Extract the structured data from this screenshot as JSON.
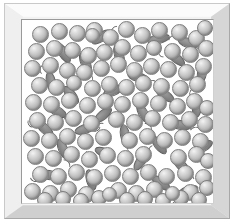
{
  "figure": {
    "frame": {
      "style": "beveled-3d-picture-frame",
      "outer_color": "#f2f2f2",
      "bevel_top_color": "#fbfbfb",
      "bevel_left_color": "#efefef",
      "bevel_right_color": "#d6d6d6",
      "bevel_bottom_color": "#cfcfcf",
      "inner_border_color": "#9a9a9a",
      "interior_background": "#ffffff"
    },
    "legend": {
      "sphere_label": "sphere particle",
      "worm_label": "rod particle with tail"
    }
  },
  "chart_data": {
    "type": "scatter",
    "xlabel": "",
    "ylabel": "",
    "xlim": [
      0,
      193
    ],
    "ylim": [
      0,
      185
    ],
    "grid": false,
    "legend_position": "none",
    "counts": {
      "spheres": 113,
      "worms": 31
    },
    "sphere_style": {
      "diameter_px": 17,
      "fill_highlight": "#f4f4f4",
      "fill_mid": "#c0c0c0",
      "fill_shadow": "#8e8e8e",
      "outline": "#7d7d7d"
    },
    "worm_style": {
      "length_px": 22,
      "width_px": 10,
      "fill_highlight": "#9e9e9e",
      "fill_shadow": "#6e6e6e",
      "outline": "#5f5f5f",
      "tail": "thin-curved-whisker"
    },
    "series": [
      {
        "name": "spheres",
        "marker": "circle",
        "points": [
          {
            "x": 10,
            "y": 6,
            "d": 17
          },
          {
            "x": 29,
            "y": 3,
            "d": 17
          },
          {
            "x": 47,
            "y": 5,
            "d": 17
          },
          {
            "x": 64,
            "y": 2,
            "d": 17
          },
          {
            "x": 80,
            "y": 9,
            "d": 17
          },
          {
            "x": 96,
            "y": 1,
            "d": 17
          },
          {
            "x": 112,
            "y": 7,
            "d": 17
          },
          {
            "x": 129,
            "y": 2,
            "d": 17
          },
          {
            "x": 149,
            "y": 4,
            "d": 17
          },
          {
            "x": 166,
            "y": 10,
            "d": 17
          },
          {
            "x": 175,
            "y": 0,
            "d": 16
          },
          {
            "x": 6,
            "y": 23,
            "d": 17
          },
          {
            "x": 24,
            "y": 20,
            "d": 17
          },
          {
            "x": 42,
            "y": 22,
            "d": 17
          },
          {
            "x": 58,
            "y": 27,
            "d": 17
          },
          {
            "x": 74,
            "y": 24,
            "d": 17
          },
          {
            "x": 92,
            "y": 19,
            "d": 17
          },
          {
            "x": 108,
            "y": 25,
            "d": 17
          },
          {
            "x": 124,
            "y": 20,
            "d": 16
          },
          {
            "x": 142,
            "y": 23,
            "d": 17
          },
          {
            "x": 160,
            "y": 26,
            "d": 17
          },
          {
            "x": 176,
            "y": 20,
            "d": 17
          },
          {
            "x": 2,
            "y": 40,
            "d": 17
          },
          {
            "x": 20,
            "y": 37,
            "d": 17
          },
          {
            "x": 37,
            "y": 42,
            "d": 17
          },
          {
            "x": 54,
            "y": 44,
            "d": 17
          },
          {
            "x": 71,
            "y": 40,
            "d": 17
          },
          {
            "x": 88,
            "y": 36,
            "d": 17
          },
          {
            "x": 104,
            "y": 42,
            "d": 17
          },
          {
            "x": 121,
            "y": 38,
            "d": 17
          },
          {
            "x": 138,
            "y": 41,
            "d": 17
          },
          {
            "x": 156,
            "y": 44,
            "d": 17
          },
          {
            "x": 173,
            "y": 38,
            "d": 17
          },
          {
            "x": 9,
            "y": 57,
            "d": 17
          },
          {
            "x": 26,
            "y": 59,
            "d": 17
          },
          {
            "x": 44,
            "y": 55,
            "d": 16
          },
          {
            "x": 62,
            "y": 60,
            "d": 17
          },
          {
            "x": 79,
            "y": 56,
            "d": 17
          },
          {
            "x": 96,
            "y": 59,
            "d": 17
          },
          {
            "x": 113,
            "y": 55,
            "d": 17
          },
          {
            "x": 131,
            "y": 58,
            "d": 17
          },
          {
            "x": 150,
            "y": 60,
            "d": 17
          },
          {
            "x": 167,
            "y": 56,
            "d": 17
          },
          {
            "x": 3,
            "y": 74,
            "d": 17
          },
          {
            "x": 21,
            "y": 76,
            "d": 17
          },
          {
            "x": 39,
            "y": 72,
            "d": 17
          },
          {
            "x": 57,
            "y": 77,
            "d": 17
          },
          {
            "x": 75,
            "y": 73,
            "d": 17
          },
          {
            "x": 92,
            "y": 76,
            "d": 17
          },
          {
            "x": 110,
            "y": 72,
            "d": 17
          },
          {
            "x": 128,
            "y": 75,
            "d": 17
          },
          {
            "x": 147,
            "y": 78,
            "d": 17
          },
          {
            "x": 164,
            "y": 73,
            "d": 17
          },
          {
            "x": 177,
            "y": 80,
            "d": 16
          },
          {
            "x": 7,
            "y": 92,
            "d": 17
          },
          {
            "x": 25,
            "y": 94,
            "d": 17
          },
          {
            "x": 43,
            "y": 90,
            "d": 17
          },
          {
            "x": 61,
            "y": 95,
            "d": 17
          },
          {
            "x": 86,
            "y": 91,
            "d": 17
          },
          {
            "x": 104,
            "y": 94,
            "d": 17
          },
          {
            "x": 122,
            "y": 90,
            "d": 17
          },
          {
            "x": 140,
            "y": 94,
            "d": 17
          },
          {
            "x": 159,
            "y": 91,
            "d": 17
          },
          {
            "x": 175,
            "y": 96,
            "d": 17
          },
          {
            "x": 1,
            "y": 110,
            "d": 17
          },
          {
            "x": 19,
            "y": 112,
            "d": 17
          },
          {
            "x": 37,
            "y": 108,
            "d": 17
          },
          {
            "x": 55,
            "y": 113,
            "d": 17
          },
          {
            "x": 73,
            "y": 109,
            "d": 17
          },
          {
            "x": 99,
            "y": 112,
            "d": 17
          },
          {
            "x": 117,
            "y": 108,
            "d": 17
          },
          {
            "x": 134,
            "y": 112,
            "d": 17
          },
          {
            "x": 152,
            "y": 109,
            "d": 17
          },
          {
            "x": 170,
            "y": 113,
            "d": 17
          },
          {
            "x": 5,
            "y": 128,
            "d": 17
          },
          {
            "x": 23,
            "y": 130,
            "d": 17
          },
          {
            "x": 41,
            "y": 126,
            "d": 17
          },
          {
            "x": 59,
            "y": 131,
            "d": 17
          },
          {
            "x": 77,
            "y": 127,
            "d": 17
          },
          {
            "x": 95,
            "y": 130,
            "d": 17
          },
          {
            "x": 113,
            "y": 126,
            "d": 17
          },
          {
            "x": 148,
            "y": 129,
            "d": 17
          },
          {
            "x": 166,
            "y": 126,
            "d": 17
          },
          {
            "x": 178,
            "y": 133,
            "d": 16
          },
          {
            "x": 10,
            "y": 146,
            "d": 17
          },
          {
            "x": 28,
            "y": 148,
            "d": 17
          },
          {
            "x": 46,
            "y": 144,
            "d": 17
          },
          {
            "x": 64,
            "y": 149,
            "d": 17
          },
          {
            "x": 82,
            "y": 145,
            "d": 17
          },
          {
            "x": 100,
            "y": 148,
            "d": 17
          },
          {
            "x": 118,
            "y": 144,
            "d": 17
          },
          {
            "x": 136,
            "y": 148,
            "d": 17
          },
          {
            "x": 155,
            "y": 145,
            "d": 17
          },
          {
            "x": 173,
            "y": 149,
            "d": 17
          },
          {
            "x": 2,
            "y": 163,
            "d": 17
          },
          {
            "x": 20,
            "y": 165,
            "d": 17
          },
          {
            "x": 38,
            "y": 161,
            "d": 17
          },
          {
            "x": 56,
            "y": 166,
            "d": 17
          },
          {
            "x": 88,
            "y": 162,
            "d": 17
          },
          {
            "x": 106,
            "y": 165,
            "d": 17
          },
          {
            "x": 124,
            "y": 161,
            "d": 17
          },
          {
            "x": 160,
            "y": 164,
            "d": 17
          },
          {
            "x": 177,
            "y": 160,
            "d": 16
          },
          {
            "x": 15,
            "y": 172,
            "d": 16
          },
          {
            "x": 33,
            "y": 171,
            "d": 16
          },
          {
            "x": 51,
            "y": 173,
            "d": 16
          },
          {
            "x": 69,
            "y": 170,
            "d": 16
          },
          {
            "x": 97,
            "y": 172,
            "d": 16
          },
          {
            "x": 115,
            "y": 171,
            "d": 16
          },
          {
            "x": 133,
            "y": 173,
            "d": 16
          },
          {
            "x": 151,
            "y": 170,
            "d": 16
          },
          {
            "x": 169,
            "y": 172,
            "d": 16
          },
          {
            "x": 80,
            "y": 167,
            "d": 15
          },
          {
            "x": 143,
            "y": 166,
            "d": 15
          },
          {
            "x": 63,
            "y": 8,
            "d": 15
          }
        ]
      },
      {
        "name": "worms",
        "marker": "ellipse-with-tail",
        "points": [
          {
            "x": 30,
            "y": 28,
            "w": 23,
            "h": 10,
            "rot": 58,
            "tail": "right"
          },
          {
            "x": 68,
            "y": 12,
            "w": 22,
            "h": 10,
            "rot": -35,
            "tail": "right"
          },
          {
            "x": 86,
            "y": 30,
            "w": 22,
            "h": 10,
            "rot": 72,
            "tail": "left"
          },
          {
            "x": 125,
            "y": 14,
            "w": 23,
            "h": 10,
            "rot": -12,
            "tail": "right"
          },
          {
            "x": 155,
            "y": 18,
            "w": 22,
            "h": 10,
            "rot": 20,
            "tail": "right"
          },
          {
            "x": 143,
            "y": 33,
            "w": 22,
            "h": 10,
            "rot": 40,
            "tail": "left"
          },
          {
            "x": 52,
            "y": 38,
            "w": 23,
            "h": 10,
            "rot": 66,
            "tail": "right"
          },
          {
            "x": 18,
            "y": 57,
            "w": 22,
            "h": 10,
            "rot": 78,
            "tail": "left"
          },
          {
            "x": 105,
            "y": 52,
            "w": 22,
            "h": 10,
            "rot": 15,
            "tail": "right"
          },
          {
            "x": 169,
            "y": 48,
            "w": 22,
            "h": 10,
            "rot": 100,
            "tail": "right"
          },
          {
            "x": 38,
            "y": 70,
            "w": 22,
            "h": 10,
            "rot": 50,
            "tail": "left"
          },
          {
            "x": 80,
            "y": 66,
            "w": 22,
            "h": 10,
            "rot": -25,
            "tail": "right"
          },
          {
            "x": 132,
            "y": 70,
            "w": 22,
            "h": 10,
            "rot": 35,
            "tail": "right"
          },
          {
            "x": 164,
            "y": 82,
            "w": 22,
            "h": 10,
            "rot": 95,
            "tail": "left"
          },
          {
            "x": 24,
            "y": 86,
            "w": 22,
            "h": 10,
            "rot": 30,
            "tail": "right"
          },
          {
            "x": 70,
            "y": 90,
            "w": 22,
            "h": 10,
            "rot": -40,
            "tail": "left"
          },
          {
            "x": 110,
            "y": 88,
            "w": 22,
            "h": 10,
            "rot": 62,
            "tail": "right"
          },
          {
            "x": 148,
            "y": 100,
            "w": 22,
            "h": 10,
            "rot": 10,
            "tail": "right"
          },
          {
            "x": 12,
            "y": 104,
            "w": 22,
            "h": 10,
            "rot": 44,
            "tail": "left"
          },
          {
            "x": 52,
            "y": 104,
            "w": 22,
            "h": 10,
            "rot": -18,
            "tail": "right"
          },
          {
            "x": 92,
            "y": 110,
            "w": 22,
            "h": 10,
            "rot": 80,
            "tail": "right"
          },
          {
            "x": 126,
            "y": 120,
            "w": 22,
            "h": 10,
            "rot": 52,
            "tail": "left"
          },
          {
            "x": 170,
            "y": 122,
            "w": 22,
            "h": 10,
            "rot": -30,
            "tail": "right"
          },
          {
            "x": 30,
            "y": 124,
            "w": 22,
            "h": 10,
            "rot": 68,
            "tail": "right"
          },
          {
            "x": 72,
            "y": 128,
            "w": 22,
            "h": 10,
            "rot": 22,
            "tail": "left"
          },
          {
            "x": 108,
            "y": 136,
            "w": 22,
            "h": 10,
            "rot": -55,
            "tail": "right"
          },
          {
            "x": 148,
            "y": 140,
            "w": 22,
            "h": 10,
            "rot": 46,
            "tail": "right"
          },
          {
            "x": 16,
            "y": 150,
            "w": 22,
            "h": 10,
            "rot": 8,
            "tail": "left"
          },
          {
            "x": 58,
            "y": 155,
            "w": 22,
            "h": 10,
            "rot": 74,
            "tail": "right"
          },
          {
            "x": 128,
            "y": 158,
            "w": 22,
            "h": 10,
            "rot": 36,
            "tail": "right"
          },
          {
            "x": 155,
            "y": 166,
            "w": 22,
            "h": 10,
            "rot": -20,
            "tail": "left"
          }
        ]
      }
    ]
  }
}
